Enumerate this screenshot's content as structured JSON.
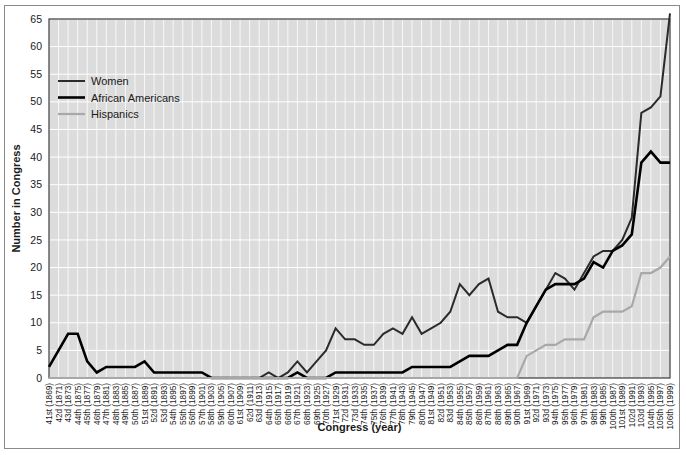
{
  "chart_data": {
    "type": "line",
    "title": "",
    "xlabel": "Congress (year)",
    "ylabel": "Number in Congress",
    "ylim": [
      0,
      65
    ],
    "yticks": [
      0,
      5,
      10,
      15,
      20,
      25,
      30,
      35,
      40,
      45,
      50,
      55,
      60,
      65
    ],
    "grid": true,
    "legend_position": "top-left",
    "categories": [
      "41st (1869)",
      "42d (1871)",
      "43d (1873)",
      "44th (1875)",
      "45th (1877)",
      "46th (1879)",
      "47th (1881)",
      "48th (1883)",
      "49th (1885)",
      "50th (1887)",
      "51st (1889)",
      "52d (1891)",
      "53d (1893)",
      "54th (1895)",
      "55th (1897)",
      "56th (1899)",
      "57th (1901)",
      "58th (1903)",
      "59th (1905)",
      "60th (1907)",
      "61st (1909)",
      "62d (1911)",
      "63d (1913)",
      "64th (1915)",
      "65th (1917)",
      "66th (1919)",
      "67th (1921)",
      "68th (1923)",
      "69th (1925)",
      "70th (1927)",
      "71st (1929)",
      "72d (1931)",
      "73d (1933)",
      "74th (1935)",
      "75th (1937)",
      "76th (1939)",
      "77th (1941)",
      "78th (1943)",
      "79th (1945)",
      "80th (1947)",
      "81st (1949)",
      "82d (1951)",
      "83d (1953)",
      "84th (1955)",
      "85th (1957)",
      "86th (1959)",
      "87th (1961)",
      "88th (1963)",
      "89th (1965)",
      "90th (1967)",
      "91st (1969)",
      "92d (1971)",
      "93d (1973)",
      "94th (1975)",
      "95th (1977)",
      "96th (1979)",
      "97th (1981)",
      "98th (1983)",
      "99th (1985)",
      "100th (1987)",
      "101st (1989)",
      "102d (1991)",
      "103d (1993)",
      "104th (1995)",
      "105th (1997)",
      "106th (1999)"
    ],
    "series": [
      {
        "name": "Women",
        "color": "#2b2b2b",
        "width": 2.0,
        "values": [
          0,
          0,
          0,
          0,
          0,
          0,
          0,
          0,
          0,
          0,
          0,
          0,
          0,
          0,
          0,
          0,
          0,
          0,
          0,
          0,
          0,
          0,
          0,
          1,
          0,
          1,
          3,
          1,
          3,
          5,
          9,
          7,
          7,
          6,
          6,
          8,
          9,
          8,
          11,
          8,
          9,
          10,
          12,
          17,
          15,
          17,
          18,
          12,
          11,
          11,
          10,
          13,
          16,
          19,
          18,
          16,
          19,
          22,
          23,
          23,
          25,
          29,
          48,
          49,
          51,
          66
        ]
      },
      {
        "name": "African Americans",
        "color": "#000000",
        "width": 2.6,
        "values": [
          2,
          5,
          8,
          8,
          3,
          1,
          2,
          2,
          2,
          2,
          3,
          1,
          1,
          1,
          1,
          1,
          1,
          0,
          0,
          0,
          0,
          0,
          0,
          0,
          0,
          0,
          1,
          0,
          0,
          0,
          1,
          1,
          1,
          1,
          1,
          1,
          1,
          1,
          2,
          2,
          2,
          2,
          2,
          3,
          4,
          4,
          4,
          5,
          6,
          6,
          10,
          13,
          16,
          17,
          17,
          17,
          18,
          21,
          20,
          23,
          24,
          26,
          39,
          41,
          39,
          39
        ]
      },
      {
        "name": "Hispanics",
        "color": "#a8a8a8",
        "width": 2.2,
        "values": [
          0,
          0,
          0,
          0,
          0,
          0,
          0,
          0,
          0,
          0,
          0,
          0,
          0,
          0,
          0,
          0,
          0,
          0,
          0,
          0,
          0,
          0,
          0,
          0,
          0,
          0,
          0,
          0,
          0,
          0,
          0,
          0,
          0,
          0,
          0,
          0,
          0,
          0,
          0,
          0,
          0,
          0,
          0,
          0,
          0,
          0,
          0,
          0,
          0,
          0,
          4,
          5,
          6,
          6,
          7,
          7,
          7,
          11,
          12,
          12,
          12,
          13,
          19,
          19,
          20,
          22
        ]
      }
    ]
  },
  "legend": {
    "entries": [
      {
        "label": "Women"
      },
      {
        "label": "African Americans"
      },
      {
        "label": "Hispanics"
      }
    ]
  }
}
